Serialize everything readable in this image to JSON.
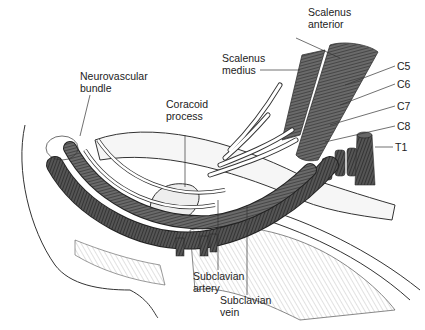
{
  "figure": {
    "labels": {
      "scalenus_anterior": "Scalenus\nanterior",
      "scalenus_medius": "Scalenus\nmedius",
      "c5": "C5",
      "c6": "C6",
      "c7": "C7",
      "c8": "C8",
      "t1": "T1",
      "neurovascular_bundle": "Neurovascular\nbundle",
      "coracoid_process": "Coracoid\nprocess",
      "subclavian_artery": "Subclavian\nartery",
      "subclavian_vein": "Subclavian\nvein"
    },
    "colors": {
      "muscle": "#5a5a5a",
      "vessel": "#4a4a4a",
      "bone": "#f4f4f4",
      "outline": "#333333",
      "leader": "#333333"
    }
  }
}
